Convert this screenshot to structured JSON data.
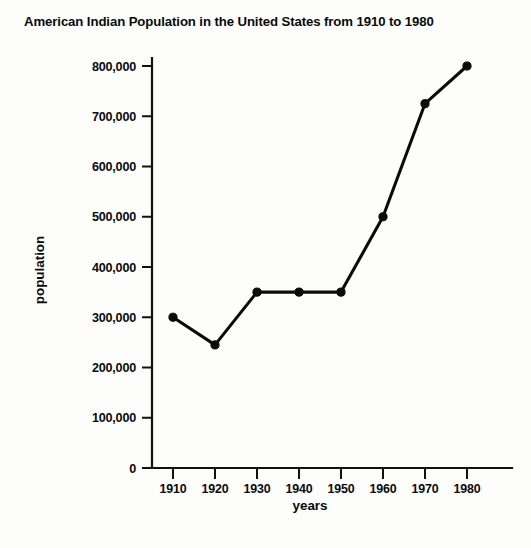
{
  "chart_data": {
    "type": "line",
    "title": "American Indian Population in the United States from 1910 to 1980",
    "xlabel": "years",
    "ylabel": "population",
    "x": [
      1910,
      1920,
      1930,
      1940,
      1950,
      1960,
      1970,
      1980
    ],
    "values": [
      300000,
      245000,
      350000,
      350000,
      350000,
      500000,
      725000,
      800000
    ],
    "series": [
      {
        "name": "American Indian population",
        "values": [
          300000,
          245000,
          350000,
          350000,
          350000,
          500000,
          725000,
          800000
        ]
      }
    ],
    "xtick_labels": [
      "1910",
      "1920",
      "1930",
      "1940",
      "1950",
      "1960",
      "1970",
      "1980"
    ],
    "ytick_values": [
      0,
      100000,
      200000,
      300000,
      400000,
      500000,
      600000,
      700000,
      800000
    ],
    "ytick_labels": [
      "0",
      "100,000",
      "200,000",
      "300,000",
      "400,000",
      "500,000",
      "600,000",
      "700,000",
      "800,000"
    ],
    "xlim": [
      1905,
      1985
    ],
    "ylim": [
      0,
      800000
    ],
    "grid": false,
    "legend": false,
    "marker": "filled-circle",
    "line_color": "#0b0b0b",
    "background_color": "#fdfdfb"
  }
}
